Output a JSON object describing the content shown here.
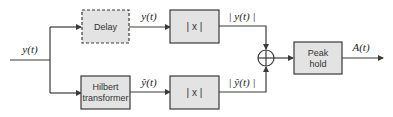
{
  "diagram": {
    "type": "block-diagram",
    "input_signal": "y(t)",
    "blocks": {
      "delay": {
        "label": "Delay",
        "style": "dashed"
      },
      "hilbert": {
        "line1": "Hilbert",
        "line2": "transformer"
      },
      "abs_top": {
        "label": "| x |"
      },
      "abs_bottom": {
        "label": "| x |"
      },
      "summer": {
        "symbol": "⊕"
      },
      "peak_hold": {
        "line1": "Peak",
        "line2": "hold"
      }
    },
    "signals": {
      "delay_out": "y(t)",
      "hilbert_out": "ŷ(t)",
      "abs_top_out": "| y(t) |",
      "abs_bottom_out": "| ŷ(t) |",
      "output": "A(t)"
    },
    "colors": {
      "block_fill": "#e3e3e3",
      "line": "#3a3a3a",
      "background": "#ffffff"
    }
  }
}
